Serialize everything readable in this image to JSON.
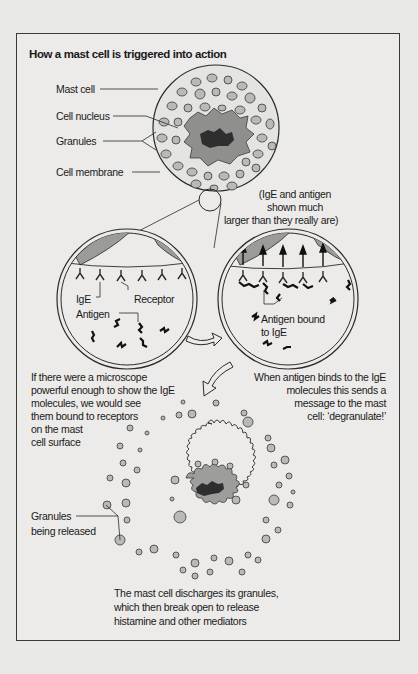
{
  "title": "How a mast cell is triggered into action",
  "labels": {
    "mast_cell": "Mast cell",
    "cell_nucleus": "Cell nucleus",
    "granules": "Granules",
    "cell_membrane": "Cell membrane",
    "scale_note": [
      "(IgE and antigen",
      "shown much",
      "larger than they really are)"
    ],
    "ige": "IgE",
    "receptor": "Receptor",
    "antigen": "Antigen",
    "antigen_bound": [
      "Antigen bound",
      "to IgE"
    ],
    "granules_released": [
      "Granules",
      "being released"
    ]
  },
  "captions": {
    "microscope": [
      "If there were a microscope",
      "powerful enough to show the IgE",
      "molecules, we would see",
      "them bound to receptors",
      "on the mast",
      "cell surface"
    ],
    "binding": [
      "When antigen binds to the IgE",
      "molecules this sends a",
      "message to the mast",
      "cell: ‘degranulate!’"
    ],
    "discharge": [
      "The mast cell discharges its granules,",
      "which then break open to release",
      "histamine and other mediators"
    ]
  },
  "colors": {
    "background": "#e9e9e7",
    "line": "#2a2a2a",
    "granule": "#b9b9b7",
    "cytoplasm_dark": "#8f8f8d",
    "nucleus": "#3a3a3a"
  }
}
